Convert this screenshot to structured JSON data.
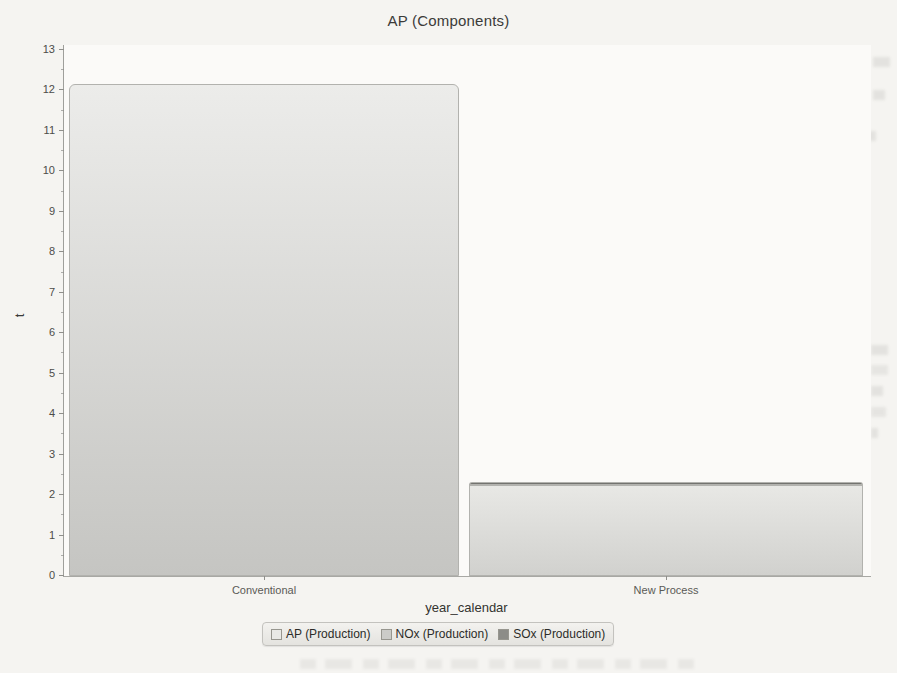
{
  "chart_data": {
    "type": "bar",
    "stacked": true,
    "title": "AP (Components)",
    "xlabel": "year_calendar",
    "ylabel": "t",
    "ylim": [
      0,
      13
    ],
    "ytick_step": 1,
    "grid": false,
    "legend_position": "bottom",
    "categories": [
      "Conventional",
      "New Process"
    ],
    "series": [
      {
        "name": "AP (Production)",
        "values": [
          12.15,
          0
        ],
        "swatch": "#e9e9e6",
        "fill_top": "#ececea",
        "fill_bottom": "#c5c5c2"
      },
      {
        "name": "NOx (Production)",
        "values": [
          0,
          2.25
        ],
        "swatch": "#cbcbc8",
        "fill_top": "#e8e8e5",
        "fill_bottom": "#d1d1ce"
      },
      {
        "name": "SOx (Production)",
        "values": [
          0,
          0.08
        ],
        "swatch": "#8c8c88",
        "fill_top": "#73736f",
        "fill_bottom": "#73736f"
      }
    ],
    "ytick_labels": [
      "0",
      "1",
      "2",
      "3",
      "4",
      "5",
      "6",
      "7",
      "8",
      "9",
      "10",
      "11",
      "12",
      "13"
    ]
  }
}
